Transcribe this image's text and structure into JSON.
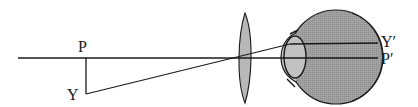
{
  "diagram": {
    "type": "optics-ray-diagram",
    "labels": {
      "object_base": "P",
      "object_tip": "Y",
      "image_tip": "Y′",
      "image_base": "P′"
    },
    "components": [
      {
        "name": "optical-axis",
        "kind": "line"
      },
      {
        "name": "object-arrow",
        "kind": "line",
        "from": "P",
        "to": "Y"
      },
      {
        "name": "chief-ray",
        "kind": "line",
        "from": "Y",
        "to": "Y′"
      },
      {
        "name": "converging-lens",
        "kind": "biconvex-lens"
      },
      {
        "name": "eyeball",
        "kind": "circle"
      },
      {
        "name": "crystalline-lens",
        "kind": "ellipse"
      },
      {
        "name": "cornea",
        "kind": "arc"
      }
    ],
    "colors": {
      "line": "#1a1a1a",
      "lens_fill": "#b4b4b4",
      "eye_fill": "#9a9a9a",
      "crystalline_fill": "#bdbdbd",
      "background": "#ffffff"
    }
  }
}
